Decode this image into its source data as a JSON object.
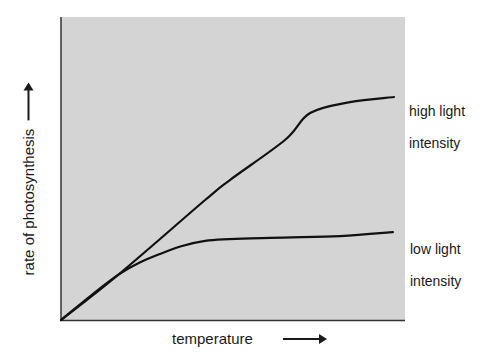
{
  "chart_data": {
    "type": "line",
    "title": "",
    "xlabel": "temperature",
    "ylabel": "rate of photosynthesis",
    "xlim": [
      0,
      100
    ],
    "ylim": [
      0,
      100
    ],
    "grid": false,
    "ticks": "none",
    "legend_position": "inline-right",
    "series": [
      {
        "name": "high light intensity",
        "label_lines": [
          "high light",
          "intensity"
        ],
        "x": [
          0,
          16.6,
          41.9,
          49.1,
          65.1,
          72.4,
          84.0,
          96.8
        ],
        "y": [
          0,
          14.9,
          39.6,
          46.2,
          59.4,
          68.3,
          71.9,
          73.6
        ]
      },
      {
        "name": "low light intensity",
        "label_lines": [
          "low light",
          "intensity"
        ],
        "x": [
          0,
          16.6,
          28.8,
          41.9,
          60.8,
          81.1,
          96.5
        ],
        "y": [
          0,
          14.9,
          21.8,
          26.1,
          27.1,
          27.7,
          29.0
        ]
      }
    ],
    "annotations": [
      "axes have arrows indicating increasing direction; no numeric scale"
    ]
  },
  "colors": {
    "plot_background": "#d4d4d4",
    "axis": "#333333",
    "line": "#111111",
    "text": "#1a1a1a"
  },
  "labels": {
    "x_axis": "temperature",
    "y_axis": "rate of photosynthesis",
    "series_high_line1": "high light",
    "series_high_line2": "intensity",
    "series_low_line1": "low light",
    "series_low_line2": "intensity"
  }
}
